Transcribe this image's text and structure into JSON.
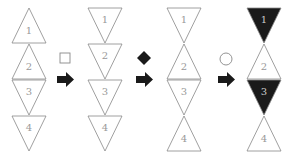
{
  "colors": {
    "stroke": "#888888",
    "fill_dark": "#1a1a1a",
    "fill_light": "#ffffff",
    "label_light": "#999999",
    "label_dark": "#cccccc",
    "arrow": "#1a1a1a"
  },
  "columns": [
    {
      "name": "column-1",
      "triangles": [
        {
          "label": "1",
          "direction": "up",
          "filled": false
        },
        {
          "label": "2",
          "direction": "up",
          "filled": false
        },
        {
          "label": "3",
          "direction": "down",
          "filled": false
        },
        {
          "label": "4",
          "direction": "down",
          "filled": false
        }
      ]
    },
    {
      "name": "column-2",
      "triangles": [
        {
          "label": "1",
          "direction": "down",
          "filled": false
        },
        {
          "label": "2",
          "direction": "down",
          "filled": false
        },
        {
          "label": "3",
          "direction": "down",
          "filled": false
        },
        {
          "label": "4",
          "direction": "down",
          "filled": false
        }
      ]
    },
    {
      "name": "column-3",
      "triangles": [
        {
          "label": "1",
          "direction": "down",
          "filled": false
        },
        {
          "label": "2",
          "direction": "up",
          "filled": false
        },
        {
          "label": "3",
          "direction": "down",
          "filled": false
        },
        {
          "label": "4",
          "direction": "up",
          "filled": false
        }
      ]
    },
    {
      "name": "column-4",
      "triangles": [
        {
          "label": "1",
          "direction": "down",
          "filled": true
        },
        {
          "label": "2",
          "direction": "up",
          "filled": false
        },
        {
          "label": "3",
          "direction": "down",
          "filled": true
        },
        {
          "label": "4",
          "direction": "up",
          "filled": false
        }
      ]
    }
  ],
  "operations": [
    {
      "symbol": "square",
      "shape": "open-square"
    },
    {
      "symbol": "diamond",
      "shape": "filled-diamond"
    },
    {
      "symbol": "circle",
      "shape": "open-circle"
    }
  ]
}
